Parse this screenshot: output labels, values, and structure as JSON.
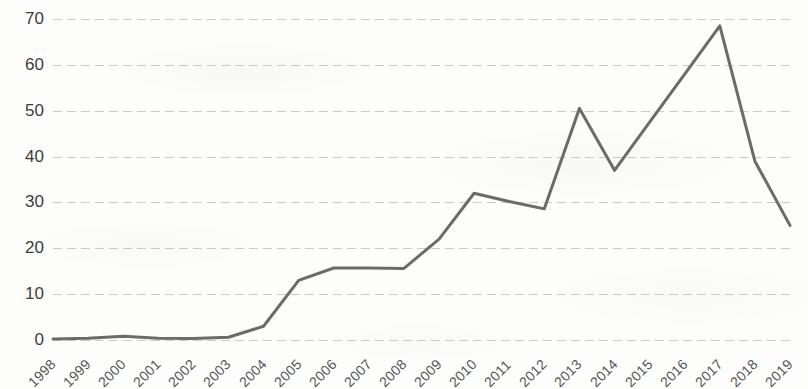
{
  "chart_data": {
    "type": "line",
    "title": "",
    "subtitle": "",
    "xlabel": "",
    "ylabel": "",
    "x": [
      1998,
      1999,
      2000,
      2001,
      2002,
      2003,
      2004,
      2005,
      2006,
      2007,
      2008,
      2009,
      2010,
      2011,
      2012,
      2013,
      2014,
      2015,
      2016,
      2017,
      2018,
      2019
    ],
    "categories": [
      "1998",
      "1999",
      "2000",
      "2001",
      "2002",
      "2003",
      "2004",
      "2005",
      "2006",
      "2007",
      "2008",
      "2009",
      "2010",
      "2011",
      "2012",
      "2013",
      "2014",
      "2015",
      "2016",
      "2017",
      "2018",
      "2019"
    ],
    "values": [
      0.2,
      0.4,
      0.8,
      0.4,
      0.3,
      0.6,
      3.0,
      13.0,
      15.7,
      15.7,
      15.6,
      22.0,
      32.0,
      30.2,
      28.6,
      50.5,
      37.0,
      47.5,
      58.0,
      68.5,
      39.0,
      25.0
    ],
    "series": [
      {
        "name": "",
        "values": [
          0.2,
          0.4,
          0.8,
          0.4,
          0.3,
          0.6,
          3.0,
          13.0,
          15.7,
          15.7,
          15.6,
          22.0,
          32.0,
          30.2,
          28.6,
          50.5,
          37.0,
          47.5,
          58.0,
          68.5,
          39.0,
          25.0
        ]
      }
    ],
    "ylim": [
      0,
      70
    ],
    "xlim": [
      1998,
      2019
    ],
    "yticks": [
      0,
      10,
      20,
      30,
      40,
      50,
      60,
      70
    ],
    "ytick_labels": [
      "0",
      "10",
      "20",
      "30",
      "40",
      "50",
      "60",
      "70"
    ],
    "grid": true,
    "grid_axis": "y",
    "legend": false,
    "legend_position": "none",
    "line_color": "#6b6b6b",
    "line_width": 3,
    "markers": false,
    "annotations": []
  },
  "axes": {
    "y_tick_labels": [
      "70",
      "60",
      "50",
      "40",
      "30",
      "20",
      "10",
      "0"
    ],
    "x_tick_labels": [
      "1998",
      "1999",
      "2000",
      "2001",
      "2002",
      "2003",
      "2004",
      "2005",
      "2006",
      "2007",
      "2008",
      "2009",
      "2010",
      "2011",
      "2012",
      "2013",
      "2014",
      "2015",
      "2016",
      "2017",
      "2018",
      "2019"
    ]
  },
  "colors": {
    "line": "#6b6b6b",
    "gridline": "#bababa",
    "tick_text": "#3d3d3d",
    "x_tick_text": "#555555",
    "background": "#fdfdfc"
  }
}
